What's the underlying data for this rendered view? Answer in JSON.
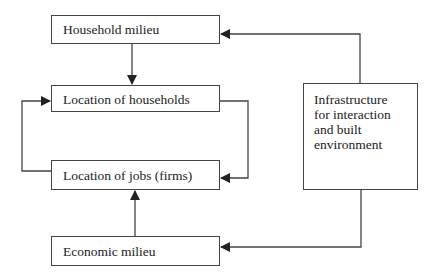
{
  "diagram": {
    "boxes": {
      "household_milieu": "Household milieu",
      "location_households": "Location of households",
      "location_jobs": "Location of jobs (firms)",
      "economic_milieu": "Economic milieu",
      "infrastructure": "Infrastructure\nfor interaction\nand built\nenvironment"
    },
    "edges": [
      {
        "from": "Household milieu",
        "to": "Location of households"
      },
      {
        "from": "Location of households",
        "to": "Location of jobs (firms)"
      },
      {
        "from": "Location of jobs (firms)",
        "to": "Location of households"
      },
      {
        "from": "Economic milieu",
        "to": "Location of jobs (firms)"
      },
      {
        "from": "Infrastructure for interaction and built environment",
        "to": "Household milieu"
      },
      {
        "from": "Infrastructure for interaction and built environment",
        "to": "Economic milieu"
      }
    ],
    "colors": {
      "line": "#444444",
      "background": "#ffffff"
    }
  }
}
